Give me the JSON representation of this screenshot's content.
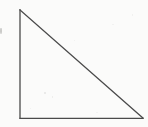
{
  "figure": {
    "kind": "scanned-line-drawing",
    "shape_name": "right triangle",
    "title": "",
    "caption": "",
    "labels": [],
    "background_color": "#fbfbfa",
    "stroke_color": "#4a4a4a",
    "stroke_width": 1.3,
    "canvas": {
      "width": 148,
      "height": 127
    },
    "vertices": {
      "apex_top_left": {
        "x": 20,
        "y": 10
      },
      "right_angle_bottom_left": {
        "x": 20,
        "y": 118
      },
      "bottom_right": {
        "x": 143,
        "y": 118
      }
    },
    "edges": [
      {
        "name": "vertical-leg",
        "from": "apex_top_left",
        "to": "right_angle_bottom_left",
        "length_px": 108
      },
      {
        "name": "horizontal-leg",
        "from": "right_angle_bottom_left",
        "to": "bottom_right",
        "length_px": 123
      },
      {
        "name": "hypotenuse",
        "from": "apex_top_left",
        "to": "bottom_right",
        "length_px": 163
      }
    ],
    "right_angle_at": "right_angle_bottom_left",
    "artifacts": [
      {
        "name": "left-edge-speck",
        "x": 0,
        "y": 28,
        "width": 2,
        "height": 6
      }
    ]
  }
}
